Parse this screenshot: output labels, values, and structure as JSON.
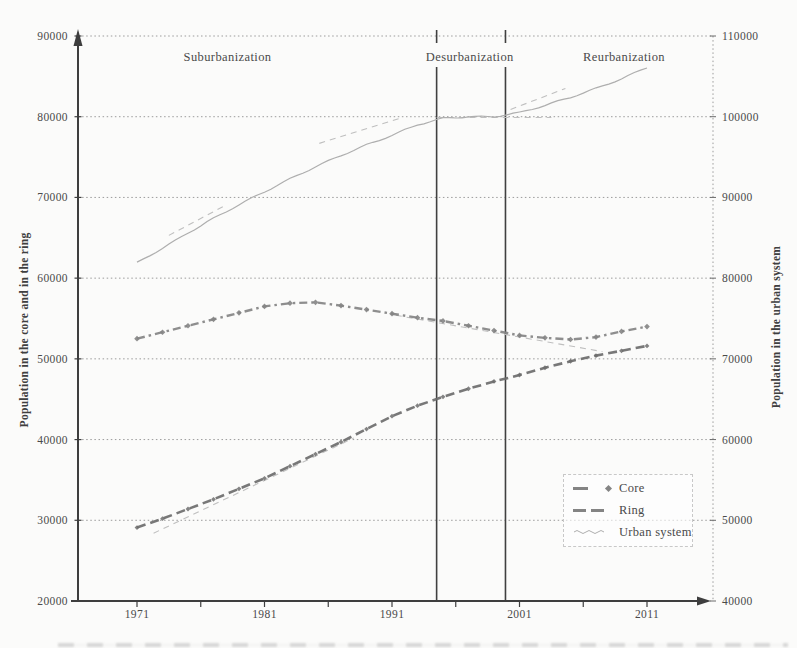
{
  "colors": {
    "axis": "#3e3e3e",
    "grid": "#9b9b9b",
    "text": "#4a4a4a",
    "core": "#848484",
    "ring": "#6d6d6d",
    "urban": "#aeaeae",
    "trend": "#bfbfbf",
    "phase_line": "#404040",
    "legend_border": "#c8c8c8"
  },
  "chart_data": {
    "type": "line",
    "title": "",
    "x": {
      "label": "",
      "range": [
        1971,
        2011
      ],
      "major_ticks": [
        1971,
        1981,
        1991,
        2001,
        2011
      ],
      "minor_ticks": [
        1971,
        1976,
        1981,
        1986,
        1991,
        1996,
        2001,
        2006,
        2011
      ]
    },
    "y_left": {
      "label": "Population in the core and in the ring",
      "range": [
        20000,
        90000
      ],
      "ticks": [
        20000,
        30000,
        40000,
        50000,
        60000,
        70000,
        80000,
        90000
      ]
    },
    "y_right": {
      "label": "Population in the urban system",
      "range": [
        40000,
        110000
      ],
      "ticks": [
        40000,
        50000,
        60000,
        70000,
        80000,
        90000,
        100000,
        110000
      ]
    },
    "grid": "horizontal-dotted",
    "legend": {
      "position": "inside-bottom-right",
      "entries": [
        "Core",
        "Ring",
        "Urban system"
      ]
    },
    "phases": [
      {
        "label": "Suburbanization",
        "label_year": 1978.1
      },
      {
        "label": "Desurbanization",
        "label_year": 1997.1
      },
      {
        "label": "Reurbanization",
        "label_year": 2009.2
      }
    ],
    "phase_boundary_years": [
      1994.5,
      1999.9
    ],
    "years": [
      1971,
      1973,
      1975,
      1977,
      1979,
      1981,
      1983,
      1985,
      1987,
      1989,
      1991,
      1993,
      1995,
      1997,
      1999,
      2001,
      2003,
      2005,
      2007,
      2009,
      2011
    ],
    "series": [
      {
        "name": "Core",
        "axis": "left",
        "style": "dash-diamond",
        "values": [
          52500,
          53300,
          54100,
          54900,
          55700,
          56500,
          56900,
          57000,
          56600,
          56100,
          55600,
          55100,
          54700,
          54100,
          53500,
          52900,
          52600,
          52400,
          52700,
          53400,
          54000
        ]
      },
      {
        "name": "Ring",
        "axis": "left",
        "style": "dash",
        "values": [
          29100,
          30200,
          31400,
          32600,
          33900,
          35200,
          36700,
          38200,
          39700,
          41300,
          42900,
          44200,
          45300,
          46300,
          47200,
          48000,
          48900,
          49700,
          50400,
          51000,
          51600
        ]
      },
      {
        "name": "Urban system",
        "axis": "right",
        "style": "solid-thin",
        "values": [
          81900,
          83700,
          85600,
          87400,
          89100,
          90700,
          92300,
          93800,
          95200,
          96500,
          97700,
          99000,
          99800,
          100000,
          100000,
          100500,
          101400,
          102400,
          103500,
          104700,
          106100
        ]
      }
    ],
    "trend_lines": [
      {
        "axis": "right",
        "from": [
          1973.5,
          85300
        ],
        "to": [
          1977.8,
          88900
        ]
      },
      {
        "axis": "right",
        "from": [
          1985.3,
          96700
        ],
        "to": [
          1991.8,
          99900
        ]
      },
      {
        "axis": "right",
        "from": [
          1994.5,
          99900
        ],
        "to": [
          2003.5,
          99900
        ]
      },
      {
        "axis": "right",
        "from": [
          2000.3,
          100900
        ],
        "to": [
          2004.6,
          103500
        ]
      },
      {
        "axis": "left",
        "from": [
          1991.3,
          55400
        ],
        "to": [
          2007.5,
          50900
        ]
      },
      {
        "axis": "left",
        "from": [
          1972.3,
          28400
        ],
        "to": [
          1988.0,
          40200
        ]
      }
    ]
  }
}
